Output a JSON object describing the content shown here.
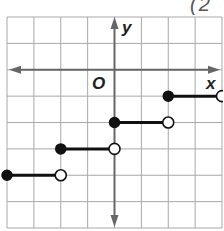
{
  "corner_label": "(2",
  "chart_data": {
    "type": "line",
    "subtype": "step-function",
    "title": "",
    "xlabel": "x",
    "ylabel": "y",
    "origin_label": "O",
    "xlim": [
      -4,
      4
    ],
    "ylim": [
      -6,
      2
    ],
    "grid": true,
    "tick_labels": false,
    "segments": [
      {
        "y": -1,
        "x_start": 2,
        "x_end": 4,
        "start": "closed",
        "end": "open"
      },
      {
        "y": -2,
        "x_start": 0,
        "x_end": 2,
        "start": "closed",
        "end": "open"
      },
      {
        "y": -3,
        "x_start": -2,
        "x_end": 0,
        "start": "closed",
        "end": "open"
      },
      {
        "y": -4,
        "x_start": -4,
        "x_end": -2,
        "start": "closed",
        "end": "open"
      }
    ],
    "colors": {
      "grid": "#a8a8a8",
      "axis": "#666666",
      "step": "#111111"
    }
  }
}
